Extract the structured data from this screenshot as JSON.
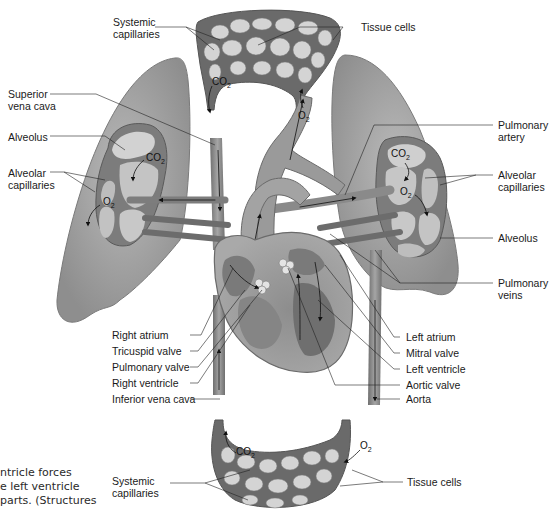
{
  "diagram": {
    "labels_left": [
      {
        "id": "systemic-capillaries-top",
        "text": "Systemic\ncapillaries"
      },
      {
        "id": "superior-vena-cava",
        "text": "Superior\nvena cava"
      },
      {
        "id": "alveolus-left",
        "text": "Alveolus"
      },
      {
        "id": "alveolar-capillaries-left",
        "text": "Alveolar\ncapillaries"
      },
      {
        "id": "right-atrium",
        "text": "Right atrium"
      },
      {
        "id": "tricuspid-valve",
        "text": "Tricuspid valve"
      },
      {
        "id": "pulmonary-valve",
        "text": "Pulmonary valve"
      },
      {
        "id": "right-ventricle",
        "text": "Right ventricle"
      },
      {
        "id": "inferior-vena-cava",
        "text": "Inferior vena cava"
      },
      {
        "id": "systemic-capillaries-bottom",
        "text": "Systemic\ncapillaries"
      }
    ],
    "labels_right": [
      {
        "id": "tissue-cells-top",
        "text": "Tissue cells"
      },
      {
        "id": "pulmonary-artery",
        "text": "Pulmonary\nartery"
      },
      {
        "id": "alveolar-capillaries-right",
        "text": "Alveolar\ncapillaries"
      },
      {
        "id": "alveolus-right",
        "text": "Alveolus"
      },
      {
        "id": "pulmonary-veins",
        "text": "Pulmonary\nveins"
      },
      {
        "id": "left-atrium",
        "text": "Left atrium"
      },
      {
        "id": "mitral-valve",
        "text": "Mitral valve"
      },
      {
        "id": "left-ventricle",
        "text": "Left ventricle"
      },
      {
        "id": "aortic-valve",
        "text": "Aortic valve"
      },
      {
        "id": "aorta",
        "text": "Aorta"
      },
      {
        "id": "tissue-cells-bottom",
        "text": "Tissue cells"
      }
    ],
    "gas_labels": {
      "co2": "CO",
      "o2": "O",
      "sub": "2"
    },
    "caption_lines": [
      "ntricle forces",
      "e left ventricle",
      "parts. (Structures"
    ],
    "colors": {
      "lung": "#9c9c9c",
      "lung_light": "#b8b8b8",
      "vessel": "#8a8a8a",
      "vessel_dark": "#5e5e5e",
      "capillary_bed": "#6b6b6b",
      "cell": "#d6d6d6",
      "leader": "#222222"
    }
  }
}
